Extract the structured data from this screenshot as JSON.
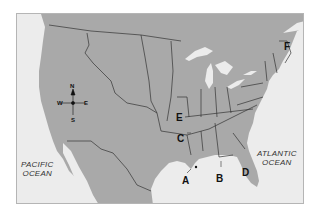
{
  "map": {
    "description": "Outline map of the United States (eastern/southern regions) with lettered locations",
    "colors": {
      "land": "#a9a9a9",
      "water": "#ececec",
      "lakes": "#ececec",
      "border": "#333333",
      "frame_border": "#b5b5b5"
    },
    "compass": {
      "north": "N",
      "south": "S",
      "east": "E",
      "west": "W"
    },
    "oceans": [
      {
        "id": "pacific",
        "line1": "PACIFIC",
        "line2": "OCEAN"
      },
      {
        "id": "atlantic",
        "line1": "ATLANTIC",
        "line2": "OCEAN"
      }
    ],
    "labels": [
      {
        "letter": "A",
        "meaning": "Gulf coast near New Orleans (Mississippi River mouth)"
      },
      {
        "letter": "B",
        "meaning": "Gulf coast, Alabama/Florida panhandle"
      },
      {
        "letter": "C",
        "meaning": "Arkansas"
      },
      {
        "letter": "D",
        "meaning": "Florida"
      },
      {
        "letter": "E",
        "meaning": "Missouri"
      },
      {
        "letter": "F",
        "meaning": "Maine"
      }
    ]
  }
}
